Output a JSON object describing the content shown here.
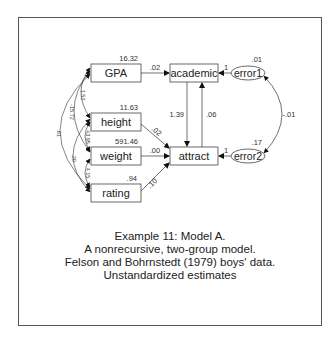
{
  "diagram": {
    "observed_variables": [
      {
        "id": "gpa",
        "label": "GPA",
        "variance": "16.32"
      },
      {
        "id": "height",
        "label": "height",
        "variance": "11.63"
      },
      {
        "id": "weight",
        "label": "weight",
        "variance": "591.46"
      },
      {
        "id": "rating",
        "label": "rating",
        "variance": ".94"
      }
    ],
    "endogenous_variables": [
      {
        "id": "academic",
        "label": "academic"
      },
      {
        "id": "attract",
        "label": "attract"
      }
    ],
    "error_terms": [
      {
        "id": "error1",
        "label": "error1",
        "variance": ".01"
      },
      {
        "id": "error2",
        "label": "error2",
        "variance": ".17"
      }
    ],
    "paths": [
      {
        "from": "GPA",
        "to": "academic",
        "estimate": ".02"
      },
      {
        "from": "height",
        "to": "attract",
        "estimate": ".02"
      },
      {
        "from": "weight",
        "to": "attract",
        "estimate": ".00"
      },
      {
        "from": "rating",
        "to": "attract",
        "estimate": ".10"
      },
      {
        "from": "academic",
        "to": "attract",
        "estimate": "1.39"
      },
      {
        "from": "attract",
        "to": "academic",
        "estimate": ".06"
      },
      {
        "from": "error1",
        "to": "academic",
        "estimate": "1"
      },
      {
        "from": "error2",
        "to": "attract",
        "estimate": "1"
      }
    ],
    "covariances": [
      {
        "between": [
          "GPA",
          "height"
        ],
        "estimate": "1.52"
      },
      {
        "between": [
          "GPA",
          "weight"
        ],
        "estimate": "-15.72"
      },
      {
        "between": [
          "GPA",
          "rating"
        ],
        "estimate": ".81"
      },
      {
        "between": [
          "height",
          "weight"
        ],
        "estimate": "43.95"
      },
      {
        "between": [
          "height",
          "rating"
        ],
        "estimate": ".20"
      },
      {
        "between": [
          "weight",
          "rating"
        ],
        "estimate": "4.15"
      },
      {
        "between": [
          "error1",
          "error2"
        ],
        "estimate": "-.01"
      }
    ]
  },
  "caption": {
    "line1": "Example 11: Model A.",
    "line2": "A nonrecursive, two-group model.",
    "line3": "Felson and Bohrnstedt (1979) boys' data.",
    "line4": "Unstandardized estimates"
  }
}
